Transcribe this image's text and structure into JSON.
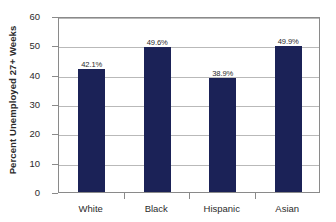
{
  "chart_data": {
    "type": "bar",
    "title": "",
    "xlabel": "",
    "ylabel": "Percent Unemployed 27+ Weeks",
    "categories": [
      "White",
      "Black",
      "Hispanic",
      "Asian"
    ],
    "values": [
      42.1,
      49.6,
      38.9,
      49.9
    ],
    "data_labels": [
      "42.1%",
      "49.6%",
      "38.9%",
      "49.9%"
    ],
    "ylim": [
      0,
      60
    ],
    "ytick_labels": [
      "0",
      "10",
      "20",
      "30",
      "40",
      "50",
      "60"
    ],
    "ytick_values": [
      0,
      10,
      20,
      30,
      40,
      50,
      60
    ],
    "grid": true,
    "legend": false,
    "legend_position": "none",
    "series": [
      {
        "name": "Percent Unemployed 27+ Weeks",
        "color": "#1b2257",
        "values": [
          42.1,
          49.6,
          38.9,
          49.9
        ]
      }
    ],
    "colors": {
      "bar": "#1b2257",
      "gridline": "#b9b9b9",
      "axis": "#8a8a8a",
      "text": "#2b2b2b",
      "plot_background": "#ffffff"
    }
  }
}
